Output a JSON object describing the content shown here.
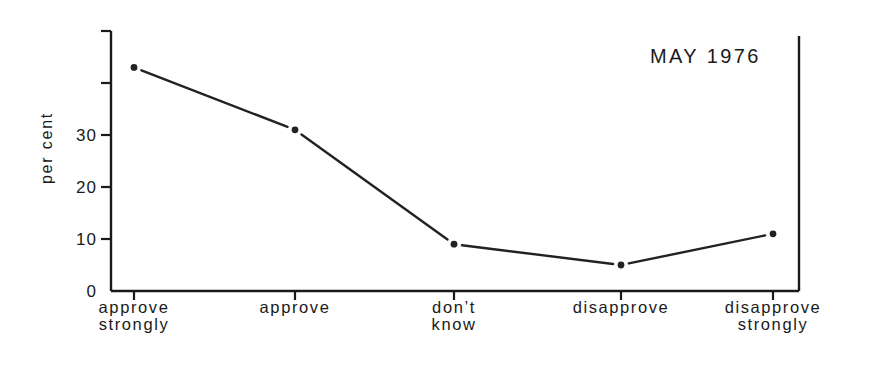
{
  "chart_data": {
    "type": "line",
    "title": "MAY 1976",
    "xlabel": "",
    "ylabel": "per cent",
    "categories": [
      [
        "approve",
        "strongly"
      ],
      [
        "approve"
      ],
      [
        "don’t",
        "know"
      ],
      [
        "disapprove"
      ],
      [
        "disapprove",
        "strongly"
      ]
    ],
    "category_names": [
      "approve strongly",
      "approve",
      "don't know",
      "disapprove",
      "disapprove strongly"
    ],
    "values": [
      43,
      31,
      9,
      5,
      11
    ],
    "ylim": [
      0,
      50
    ],
    "yticks": [
      0,
      10,
      20,
      30,
      40,
      50
    ],
    "ytick_labels": [
      "0",
      "10",
      "20",
      "30",
      "",
      ""
    ],
    "grid": false,
    "legend": null,
    "colors": {
      "line": "#222222",
      "axis": "#1a1a1a",
      "background": "#ffffff"
    }
  }
}
